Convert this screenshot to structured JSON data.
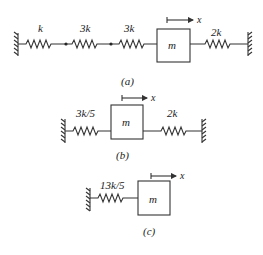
{
  "figure": {
    "panels": [
      {
        "id": "a",
        "caption": "(a)",
        "springs": [
          {
            "label": "k"
          },
          {
            "label": "3k"
          },
          {
            "label": "3k"
          },
          {
            "label": "2k"
          }
        ],
        "mass_label": "m",
        "displacement_label": "x"
      },
      {
        "id": "b",
        "caption": "(b)",
        "springs": [
          {
            "label": "3k/5"
          },
          {
            "label": "2k"
          }
        ],
        "mass_label": "m",
        "displacement_label": "x"
      },
      {
        "id": "c",
        "caption": "(c)",
        "springs": [
          {
            "label": "13k/5"
          }
        ],
        "mass_label": "m",
        "displacement_label": "x"
      }
    ]
  }
}
